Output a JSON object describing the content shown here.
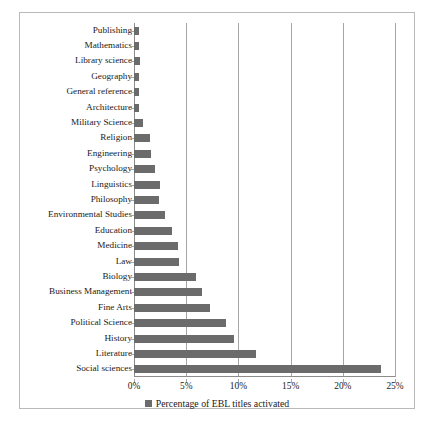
{
  "chart_data": {
    "type": "bar",
    "orientation": "horizontal",
    "title": "",
    "subtitle": "",
    "xlabel": "",
    "ylabel": "",
    "xlim": [
      0,
      25
    ],
    "xtick_labels": [
      "0%",
      "5%",
      "10%",
      "15%",
      "20%",
      "25%"
    ],
    "xtick_values": [
      0,
      5,
      10,
      15,
      20,
      25
    ],
    "grid": true,
    "grid_axis": "x",
    "legend_position": "bottom",
    "legend_entries": [
      "Percentage of EBL titles activated"
    ],
    "series": [
      {
        "name": "Percentage of EBL titles activated",
        "color": "#6b6b6b",
        "values": [
          0.5,
          0.5,
          0.6,
          0.5,
          0.5,
          0.5,
          0.9,
          1.5,
          1.6,
          2.0,
          2.5,
          2.4,
          3.0,
          3.6,
          4.2,
          4.3,
          5.9,
          6.5,
          7.3,
          8.8,
          9.6,
          11.7,
          23.7
        ]
      }
    ],
    "categories": [
      "Publishing",
      "Mathematics",
      "Library science",
      "Geography",
      "General reference",
      "Architecture",
      "Military Science",
      "Religion",
      "Engineering",
      "Psychology",
      "Linguistics",
      "Philosophy",
      "Environmental Studies",
      "Education",
      "Medicine",
      "Law",
      "Biology",
      "Business Management",
      "Fine Arts",
      "Political Science",
      "History",
      "Literature",
      "Social sciences"
    ]
  },
  "legend": {
    "label": "Percentage of EBL titles activated"
  },
  "caption": {
    "text": ""
  },
  "colors": {
    "bar": "#6b6b6b",
    "grid": "#a6a6a6",
    "axis": "#8c8c8c",
    "frame": "#b9b9b9",
    "text": "#1a1a1a"
  }
}
